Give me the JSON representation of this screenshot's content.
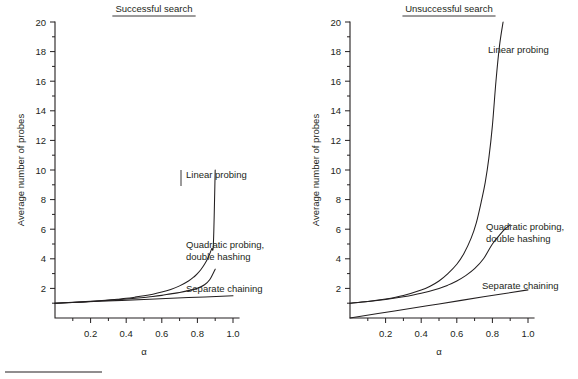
{
  "figure": {
    "background": "#ffffff",
    "ink_color": "#231f20",
    "bottom_rule": true
  },
  "chart_data": [
    {
      "type": "line",
      "title": "Successful search",
      "title_underlined": true,
      "xlabel": "α",
      "ylabel": "Average number of probes",
      "xlim": [
        0,
        1.0
      ],
      "ylim": [
        0,
        20
      ],
      "xticks": [
        0.2,
        0.4,
        0.6,
        0.8,
        1.0
      ],
      "xtick_labels": [
        "0.2",
        "0.4",
        "0.6",
        "0.8",
        "1.0"
      ],
      "xminor_step": 0.1,
      "yticks": [
        2,
        4,
        6,
        8,
        10,
        12,
        14,
        16,
        18,
        20
      ],
      "ytick_labels": [
        "2",
        "4",
        "6",
        "8",
        "10",
        "12",
        "14",
        "16",
        "18",
        "20"
      ],
      "yminor_step": 1,
      "grid": false,
      "legend_position": "inline-annotations",
      "series": [
        {
          "name": "Linear probing",
          "label": "Linear probing",
          "x": [
            0.0,
            0.05,
            0.1,
            0.15,
            0.2,
            0.25,
            0.3,
            0.35,
            0.4,
            0.45,
            0.5,
            0.55,
            0.6,
            0.65,
            0.7,
            0.75,
            0.78,
            0.8,
            0.82,
            0.84,
            0.86,
            0.88,
            0.89,
            0.9
          ],
          "values": [
            1.0,
            1.03,
            1.06,
            1.09,
            1.13,
            1.17,
            1.21,
            1.27,
            1.33,
            1.41,
            1.5,
            1.61,
            1.75,
            1.93,
            2.17,
            2.5,
            2.77,
            3.0,
            3.28,
            3.63,
            4.07,
            4.67,
            5.05,
            10.0
          ]
        },
        {
          "name": "Quadratic probing, double hashing",
          "label": "Quadratic probing,\ndouble hashing",
          "label_line1": "Quadratic probing,",
          "label_line2": "double hashing",
          "x": [
            0.0,
            0.1,
            0.2,
            0.3,
            0.4,
            0.5,
            0.55,
            0.6,
            0.65,
            0.7,
            0.75,
            0.8,
            0.84,
            0.87,
            0.9
          ],
          "values": [
            1.0,
            1.05,
            1.12,
            1.19,
            1.28,
            1.39,
            1.45,
            1.53,
            1.63,
            1.72,
            1.85,
            2.01,
            2.25,
            2.6,
            3.3
          ]
        },
        {
          "name": "Separate chaining",
          "label": "Separate chaining",
          "x": [
            0.0,
            0.25,
            0.5,
            0.75,
            1.0
          ],
          "values": [
            1.0,
            1.13,
            1.25,
            1.38,
            1.5
          ]
        }
      ]
    },
    {
      "type": "line",
      "title": "Unsuccessful search",
      "title_underlined": true,
      "xlabel": "α",
      "ylabel": "Average number of probes",
      "xlim": [
        0,
        1.0
      ],
      "ylim": [
        0,
        20
      ],
      "xticks": [
        0.2,
        0.4,
        0.6,
        0.8,
        1.0
      ],
      "xtick_labels": [
        "0.2",
        "0.4",
        "0.6",
        "0.8",
        "1.0"
      ],
      "xminor_step": 0.1,
      "yticks": [
        2,
        4,
        6,
        8,
        10,
        12,
        14,
        16,
        18,
        20
      ],
      "ytick_labels": [
        "2",
        "4",
        "6",
        "8",
        "10",
        "12",
        "14",
        "16",
        "18",
        "20"
      ],
      "yminor_step": 1,
      "grid": false,
      "legend_position": "inline-annotations",
      "series": [
        {
          "name": "Linear probing",
          "label": "Linear probing",
          "x": [
            0.0,
            0.1,
            0.2,
            0.3,
            0.4,
            0.45,
            0.5,
            0.55,
            0.6,
            0.64,
            0.68,
            0.71,
            0.74,
            0.76,
            0.78,
            0.8,
            0.82,
            0.84,
            0.86
          ],
          "values": [
            1.0,
            1.12,
            1.28,
            1.52,
            1.89,
            2.15,
            2.5,
            3.0,
            3.63,
            4.36,
            5.38,
            6.45,
            8.0,
            9.18,
            10.8,
            13.0,
            16.0,
            18.4,
            20.0
          ]
        },
        {
          "name": "Quadratic probing, double hashing",
          "label": "Quadratic probing,\ndouble hashing",
          "label_line1": "Quadratic probing,",
          "label_line2": "double hashing",
          "x": [
            0.0,
            0.1,
            0.2,
            0.3,
            0.4,
            0.5,
            0.55,
            0.6,
            0.65,
            0.7,
            0.75,
            0.8,
            0.84,
            0.87,
            0.9
          ],
          "values": [
            1.0,
            1.11,
            1.25,
            1.43,
            1.67,
            2.0,
            2.22,
            2.5,
            2.86,
            3.33,
            4.0,
            5.0,
            5.6,
            6.0,
            6.3
          ]
        },
        {
          "name": "Separate chaining",
          "label": "Separate chaining",
          "x": [
            0.0,
            0.25,
            0.5,
            0.75,
            1.0
          ],
          "values": [
            0.0,
            0.48,
            0.95,
            1.43,
            1.9
          ]
        }
      ]
    }
  ]
}
